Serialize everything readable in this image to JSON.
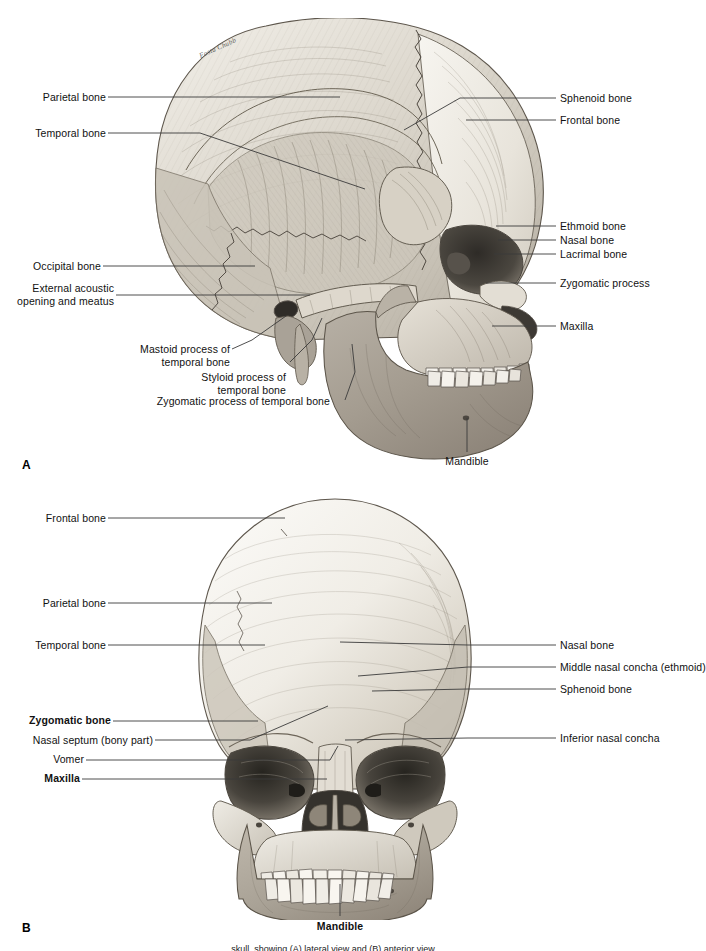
{
  "figure": {
    "signature": "Fosta Chubb",
    "caption": "skull, showing (A) lateral view and (B) anterior view"
  },
  "panels": [
    {
      "letter": "A",
      "view": "lateral view of the skull",
      "labels_left": [
        {
          "text": "Parietal bone",
          "bold": false
        },
        {
          "text": "Temporal bone",
          "bold": false
        },
        {
          "text": "Occipital bone",
          "bold": false
        },
        {
          "text": "External acoustic\nopening and meatus",
          "bold": false
        },
        {
          "text": "Mastoid process of\ntemporal bone",
          "bold": false
        },
        {
          "text": "Styloid process of\ntemporal bone",
          "bold": false
        },
        {
          "text": "Zygomatic process of temporal bone",
          "bold": false
        }
      ],
      "labels_right": [
        {
          "text": "Sphenoid bone",
          "bold": false
        },
        {
          "text": "Frontal bone",
          "bold": false
        },
        {
          "text": "Ethmoid bone",
          "bold": false
        },
        {
          "text": "Nasal bone",
          "bold": false
        },
        {
          "text": "Lacrimal bone",
          "bold": false
        },
        {
          "text": "Zygomatic process",
          "bold": false
        },
        {
          "text": "Maxilla",
          "bold": false
        }
      ],
      "labels_bottom": [
        {
          "text": "Mandible",
          "bold": false
        }
      ]
    },
    {
      "letter": "B",
      "view": "anterior view of the skull",
      "labels_left": [
        {
          "text": "Frontal bone",
          "bold": false
        },
        {
          "text": "Parietal bone",
          "bold": false
        },
        {
          "text": "Temporal bone",
          "bold": false
        },
        {
          "text": "Zygomatic bone",
          "bold": true
        },
        {
          "text": "Nasal septum (bony part)",
          "bold": false
        },
        {
          "text": "Vomer",
          "bold": false
        },
        {
          "text": "Maxilla",
          "bold": true
        }
      ],
      "labels_right": [
        {
          "text": "Nasal bone",
          "bold": false
        },
        {
          "text": "Middle nasal concha (ethmoid)",
          "bold": false
        },
        {
          "text": "Sphenoid bone",
          "bold": false
        },
        {
          "text": "Inferior nasal concha",
          "bold": false
        }
      ],
      "labels_bottom": [
        {
          "text": "Mandible",
          "bold": true
        }
      ]
    }
  ],
  "colors": {
    "leader_line": "#3b3b3b",
    "text": "#111111",
    "background": "#ffffff",
    "bone_light": "#f2efe9",
    "bone_mid": "#d8d3c9",
    "bone_shadow": "#9d968b",
    "bone_dark": "#6e6860",
    "cavity": "#3a3733"
  }
}
